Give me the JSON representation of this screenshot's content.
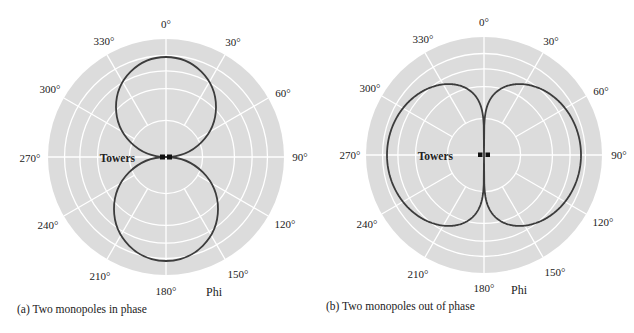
{
  "colors": {
    "disk": "#dcdcdc",
    "grid": "#ffffff",
    "pattern": "#3c3c3c",
    "marker": "#111111"
  },
  "angle_labels": [
    "0°",
    "30°",
    "60°",
    "90°",
    "120°",
    "150°",
    "180°",
    "210°",
    "240°",
    "270°",
    "300°",
    "330°"
  ],
  "panels": [
    {
      "id": "a",
      "caption": "(a) Two monopoles in phase",
      "towers_label": "Towers",
      "axis_label": "Phi",
      "pattern": "in-phase"
    },
    {
      "id": "b",
      "caption": "(b) Two monopoles out of phase",
      "towers_label": "Towers",
      "axis_label": "Phi",
      "pattern": "out-of-phase"
    }
  ],
  "chart_data": [
    {
      "type": "polar",
      "title": "(a) Two monopoles in phase",
      "angular_axis": {
        "label": "Phi",
        "ticks_deg": [
          0,
          30,
          60,
          90,
          120,
          150,
          180,
          210,
          240,
          270,
          300,
          330
        ],
        "direction": "clockwise",
        "zero": "top"
      },
      "radial_rings_fraction": [
        0.31,
        0.58,
        0.73,
        0.86,
        1.0
      ],
      "series": [
        {
          "name": "pattern",
          "shape": "two tangent circular lobes along 0° and 180°",
          "r_fraction_at_deg": {
            "0": 0.85,
            "30": 0.74,
            "60": 0.43,
            "90": 0.0,
            "120": 0.45,
            "150": 0.77,
            "180": 0.88,
            "210": 0.77,
            "240": 0.45,
            "270": 0.0,
            "300": 0.43,
            "330": 0.74
          }
        }
      ],
      "annotations": [
        "Towers"
      ],
      "grid": true
    },
    {
      "type": "polar",
      "title": "(b) Two monopoles out of phase",
      "angular_axis": {
        "label": "Phi",
        "ticks_deg": [
          0,
          30,
          60,
          90,
          120,
          150,
          180,
          210,
          240,
          270,
          300,
          330
        ],
        "direction": "clockwise",
        "zero": "top"
      },
      "radial_rings_fraction": [
        0.31,
        0.58,
        0.73,
        0.86,
        1.0
      ],
      "series": [
        {
          "name": "pattern",
          "shape": "two elongated lobes along 90° and 270°, null at 0° and 180°",
          "r_fraction_at_deg": {
            "0": 0.0,
            "30": 0.69,
            "60": 0.79,
            "90": 0.82,
            "120": 0.79,
            "150": 0.69,
            "180": 0.0,
            "210": 0.69,
            "240": 0.79,
            "270": 0.82,
            "300": 0.79,
            "330": 0.69
          }
        }
      ],
      "annotations": [
        "Towers"
      ],
      "grid": true
    }
  ]
}
